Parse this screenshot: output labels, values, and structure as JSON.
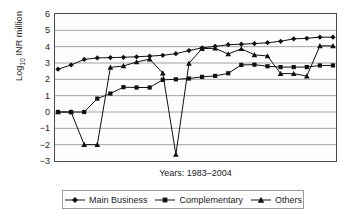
{
  "chart_data": {
    "type": "line",
    "title": "",
    "xlabel": "Years: 1983–2004",
    "ylabel": "Log10 INR million",
    "ylabel_base": "Log",
    "ylabel_sub": "10",
    "ylabel_rest": " INR million",
    "ylim": [
      -3,
      6
    ],
    "yticks": [
      6,
      5,
      4,
      3,
      2,
      1,
      0,
      -1,
      -2,
      -3
    ],
    "ytick_labels": [
      "6",
      "5",
      "4",
      "3",
      "2",
      "1",
      "0",
      "−1",
      "−2",
      "−3"
    ],
    "grid": true,
    "grid_axis": "y",
    "xticks_visible": false,
    "legend_position": "bottom",
    "x_start_year": 1983,
    "x_end_year": 2004,
    "x": [
      1983,
      1984,
      1985,
      1986,
      1987,
      1988,
      1989,
      1990,
      1991,
      1992,
      1993,
      1994,
      1995,
      1996,
      1997,
      1998,
      1999,
      2000,
      2001,
      2002,
      2003,
      2004
    ],
    "series": [
      {
        "name": "Main Business",
        "marker": "diamond",
        "values": [
          2.62,
          2.88,
          3.22,
          3.31,
          3.33,
          3.35,
          3.38,
          3.42,
          3.47,
          3.57,
          3.76,
          3.93,
          4.02,
          4.12,
          4.15,
          4.19,
          4.24,
          4.33,
          4.48,
          4.51,
          4.58,
          4.58
        ]
      },
      {
        "name": "Complementary",
        "marker": "square",
        "values": [
          0.0,
          0.0,
          0.0,
          0.82,
          1.13,
          1.52,
          1.5,
          1.5,
          1.97,
          2.0,
          2.05,
          2.15,
          2.21,
          2.37,
          2.88,
          2.9,
          2.8,
          2.75,
          2.75,
          2.75,
          2.85,
          2.85
        ]
      },
      {
        "name": "Others",
        "marker": "triangle",
        "values": [
          0.0,
          0.0,
          -2.0,
          -2.0,
          2.73,
          2.82,
          3.06,
          3.24,
          2.38,
          -2.6,
          2.98,
          3.88,
          3.9,
          3.55,
          3.87,
          3.5,
          3.43,
          2.35,
          2.35,
          2.2,
          4.05,
          4.05
        ]
      }
    ]
  },
  "legend": {
    "items": [
      {
        "label": "Main Business",
        "marker": "diamond"
      },
      {
        "label": "Complementary",
        "marker": "square"
      },
      {
        "label": "Others",
        "marker": "triangle"
      }
    ]
  }
}
